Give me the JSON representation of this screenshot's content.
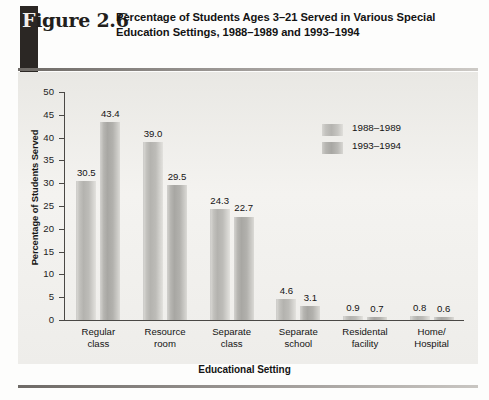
{
  "figure": {
    "number_prefix": "F",
    "number_rest": "igure 2.6",
    "title": "Percentage of Students Ages 3–21 Served in Various Special Education Settings, 1988–1989 and 1993–1994"
  },
  "chart_data": {
    "type": "bar",
    "title": "Percentage of Students Ages 3–21 Served in Various Special Education Settings, 1988–1989 and 1993–1994",
    "xlabel": "Educational Setting",
    "ylabel": "Percentage of Students Served",
    "categories": [
      "Regular class",
      "Resource room",
      "Separate class",
      "Separate school",
      "Residental facility",
      "Home/ Hospital"
    ],
    "category_lines": [
      [
        "Regular",
        "class"
      ],
      [
        "Resource",
        "room"
      ],
      [
        "Separate",
        "class"
      ],
      [
        "Separate",
        "school"
      ],
      [
        "Residental",
        "facility"
      ],
      [
        "Home/",
        "Hospital"
      ]
    ],
    "series": [
      {
        "name": "1988–1989",
        "values": [
          30.5,
          39.0,
          24.3,
          4.6,
          0.9,
          0.8
        ],
        "labels": [
          "30.5",
          "39.0",
          "24.3",
          "4.6",
          "0.9",
          "0.8"
        ],
        "color": "#b8b7b3"
      },
      {
        "name": "1993–1994",
        "values": [
          43.4,
          29.5,
          22.7,
          3.1,
          0.7,
          0.6
        ],
        "labels": [
          "43.4",
          "29.5",
          "22.7",
          "3.1",
          "0.7",
          "0.6"
        ],
        "color": "#acaba7"
      }
    ],
    "ylim": [
      0,
      50
    ],
    "yticks": [
      0,
      5,
      10,
      15,
      20,
      25,
      30,
      35,
      40,
      45,
      50
    ],
    "ytick_labels": [
      "0",
      "5",
      "10",
      "15",
      "20",
      "25",
      "30",
      "35",
      "40",
      "45",
      "50"
    ],
    "grid": false,
    "legend_position": "upper-right-inside",
    "legend": [
      "1988–1989",
      "1993–1994"
    ]
  },
  "axis": {
    "xlabel": "Educational Setting",
    "ylabel": "Percentage of Students Served"
  }
}
